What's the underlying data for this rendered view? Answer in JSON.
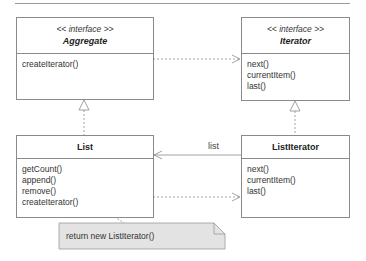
{
  "diagram": {
    "type": "UML class diagram",
    "classes": {
      "aggregate": {
        "stereotype": "<< interface >>",
        "name": "Aggregate",
        "operations": [
          "createIterator()"
        ]
      },
      "iterator": {
        "stereotype": "<< interface >>",
        "name": "Iterator",
        "operations": [
          "next()",
          "currentItem()",
          "last()"
        ]
      },
      "list": {
        "name": "List",
        "operations": [
          "getCount()",
          "append()",
          "remove()",
          "createIterator()"
        ]
      },
      "list_iterator": {
        "name": "ListIterator",
        "operations": [
          "next()",
          "currentItem()",
          "last()"
        ]
      }
    },
    "relations": {
      "association_label": "list"
    },
    "note": {
      "text": "return new ListIterator()"
    },
    "colors": {
      "line": "#8a8a8a",
      "note_fill": "#e3e3e3",
      "note_border": "#9a9a9a"
    }
  }
}
